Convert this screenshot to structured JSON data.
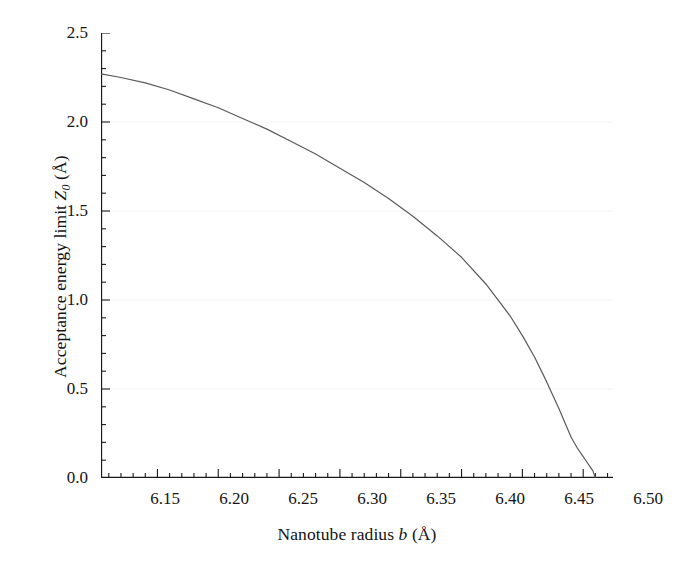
{
  "figure": {
    "background": "#ffffff",
    "line_color": "#5a5a5a",
    "axis_color": "#1a1a1a",
    "grid_color": "#f2f2f2"
  },
  "axes": {
    "x_title_prefix": "Nanotube radius ",
    "x_title_var": "b",
    "x_title_suffix": " (Å)",
    "x_title_full": "Nanotube radius b (Å)",
    "y_title_prefix": "Acceptance energy limit ",
    "y_title_var": "Z",
    "y_title_sub": "0",
    "y_title_suffix": " (Å)",
    "y_title_full": "Acceptance energy limit Z₀ (Å)",
    "x_ticks": [
      "6.15",
      "6.20",
      "6.25",
      "6.30",
      "6.35",
      "6.40",
      "6.45",
      "6.50"
    ],
    "y_ticks": [
      "0.0",
      "0.5",
      "1.0",
      "1.5",
      "2.0",
      "2.5"
    ]
  },
  "chart_data": {
    "type": "line",
    "title": "",
    "xlabel": "Nanotube radius b (Å)",
    "ylabel": "Acceptance energy limit Z0 (Å)",
    "xlim": [
      6.1036,
      6.5245
    ],
    "ylim": [
      0.0,
      2.5
    ],
    "xticks": [
      6.15,
      6.2,
      6.25,
      6.3,
      6.35,
      6.4,
      6.45,
      6.5
    ],
    "yticks": [
      0.0,
      0.5,
      1.0,
      1.5,
      2.0,
      2.5
    ],
    "x_minor_tick_step": 0.01,
    "y_minor_tick_step": 0.1,
    "grid": "faint horizontal gridlines at major y ticks",
    "legend": "none",
    "series": [
      {
        "name": "Acceptance energy limit",
        "color": "#5a5a5a",
        "linewidth": 1.2,
        "x": [
          6.1036,
          6.12,
          6.14,
          6.16,
          6.18,
          6.2,
          6.22,
          6.24,
          6.26,
          6.28,
          6.3,
          6.32,
          6.34,
          6.36,
          6.38,
          6.4,
          6.42,
          6.44,
          6.45,
          6.46,
          6.47,
          6.48,
          6.485,
          6.49,
          6.495,
          6.5,
          6.503,
          6.506,
          6.508,
          6.509,
          6.51
        ],
        "y": [
          2.27,
          2.25,
          2.22,
          2.18,
          2.13,
          2.08,
          2.02,
          1.96,
          1.89,
          1.82,
          1.74,
          1.66,
          1.57,
          1.47,
          1.36,
          1.24,
          1.09,
          0.91,
          0.8,
          0.68,
          0.54,
          0.39,
          0.31,
          0.23,
          0.17,
          0.12,
          0.09,
          0.06,
          0.04,
          0.02,
          0.0
        ]
      }
    ],
    "annotations": []
  }
}
